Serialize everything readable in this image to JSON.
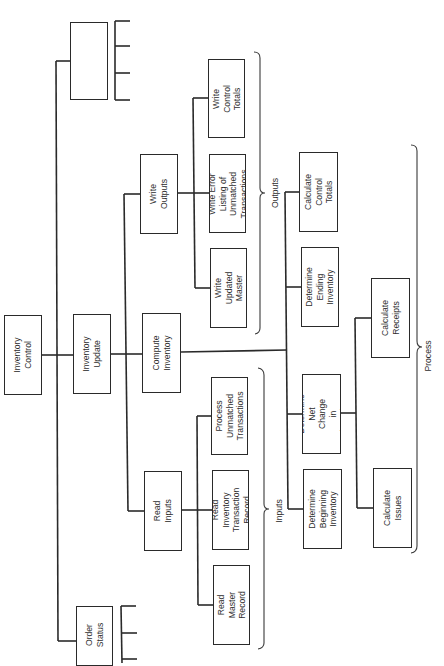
{
  "diagram": {
    "orientation": "rotated 90deg counter-clockwise (text reads bottom-to-top)",
    "root": {
      "label": "Inventory\nControl"
    },
    "level1": {
      "unnamed_box": {
        "label": ""
      },
      "inventory_update": {
        "label": "Inventory\nUpdate"
      },
      "order_status": {
        "label": "Order\nStatus"
      }
    },
    "level2": {
      "read_inputs": {
        "label": "Read\nInputs"
      },
      "compute_inventory": {
        "label": "Compute\nInventory"
      },
      "write_outputs": {
        "label": "Write\nOutputs"
      }
    },
    "inputs": {
      "group_label": "Inputs",
      "items": [
        {
          "label": "Read\nMaster\nRecord"
        },
        {
          "label": "Read Inventory\nTransaction\nRecord"
        },
        {
          "label": "Process\nUnmatched\nTransactions"
        }
      ]
    },
    "outputs": {
      "group_label": "Outputs",
      "items": [
        {
          "label": "Write\nUpdated\nMaster"
        },
        {
          "label": "Write Error\nListing of\nUnmatched\nTransactions"
        },
        {
          "label": "Write\nControl\nTotals"
        }
      ]
    },
    "process": {
      "group_label": "Process",
      "items": [
        {
          "label": "Determine\nBeginning\nInventory"
        },
        {
          "label": "Determine\nNet Change\nin Inventory"
        },
        {
          "label": "Determine\nEnding\nInventory"
        },
        {
          "label": "Calculate\nControl\nTotals"
        }
      ],
      "net_change_children": [
        {
          "label": "Calculate\nIssues"
        },
        {
          "label": "Calculate\nReceipts"
        }
      ]
    }
  },
  "colors": {
    "line": "#2a2a2a",
    "text": "#2e2e2e",
    "background": "#ffffff"
  }
}
